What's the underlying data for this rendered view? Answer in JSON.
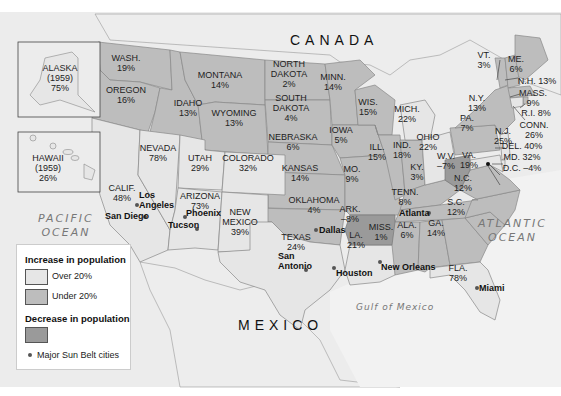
{
  "map": {
    "countries": {
      "canada": "CANADA",
      "mexico": "MEXICO"
    },
    "water": {
      "pacific": "PACIFIC\nOCEAN",
      "atlantic": "ATLANTIC\nOCEAN",
      "gulf": "Gulf of Mexico"
    },
    "colors": {
      "over20": "#e6e6e6",
      "under20": "#bdbdbd",
      "decrease": "#9a9a9a",
      "background": "#ececec",
      "water": "#f3f3f3"
    },
    "insets": {
      "alaska": {
        "label": "ALASKA\n(1959)\n75%",
        "category": "over20"
      },
      "hawaii": {
        "label": "HAWAII\n(1959)\n26%",
        "category": "over20"
      }
    },
    "states": [
      {
        "name": "WASH.",
        "change": "19%",
        "category": "under20"
      },
      {
        "name": "OREGON",
        "change": "16%",
        "category": "under20"
      },
      {
        "name": "CALIF.",
        "change": "48%",
        "category": "over20"
      },
      {
        "name": "NEVADA",
        "change": "78%",
        "category": "over20"
      },
      {
        "name": "IDAHO",
        "change": "13%",
        "category": "under20"
      },
      {
        "name": "MONTANA",
        "change": "14%",
        "category": "under20"
      },
      {
        "name": "WYOMING",
        "change": "13%",
        "category": "under20"
      },
      {
        "name": "UTAH",
        "change": "29%",
        "category": "over20"
      },
      {
        "name": "ARIZONA",
        "change": "73%",
        "category": "over20"
      },
      {
        "name": "COLORADO",
        "change": "32%",
        "category": "over20"
      },
      {
        "name": "NEW\nMEXICO",
        "change": "39%",
        "category": "over20"
      },
      {
        "name": "NORTH\nDAKOTA",
        "change": "2%",
        "category": "under20"
      },
      {
        "name": "SOUTH\nDAKOTA",
        "change": "4%",
        "category": "under20"
      },
      {
        "name": "NEBRASKA",
        "change": "6%",
        "category": "under20"
      },
      {
        "name": "KANSAS",
        "change": "14%",
        "category": "under20"
      },
      {
        "name": "OKLAHOMA",
        "change": "4%",
        "category": "under20"
      },
      {
        "name": "TEXAS",
        "change": "24%",
        "category": "over20"
      },
      {
        "name": "MINN.",
        "change": "14%",
        "category": "under20"
      },
      {
        "name": "IOWA",
        "change": "5%",
        "category": "under20"
      },
      {
        "name": "MO.",
        "change": "9%",
        "category": "under20"
      },
      {
        "name": "ARK.",
        "change": "-8%",
        "category": "decrease"
      },
      {
        "name": "LA.",
        "change": "21%",
        "category": "over20"
      },
      {
        "name": "WIS.",
        "change": "15%",
        "category": "under20"
      },
      {
        "name": "ILL.",
        "change": "15%",
        "category": "under20"
      },
      {
        "name": "MICH.",
        "change": "22%",
        "category": "over20"
      },
      {
        "name": "IND.",
        "change": "18%",
        "category": "under20"
      },
      {
        "name": "OHIO",
        "change": "22%",
        "category": "over20"
      },
      {
        "name": "KY.",
        "change": "3%",
        "category": "under20"
      },
      {
        "name": "TENN.",
        "change": "8%",
        "category": "under20"
      },
      {
        "name": "MISS.",
        "change": "1%",
        "category": "under20"
      },
      {
        "name": "ALA.",
        "change": "6%",
        "category": "under20"
      },
      {
        "name": "GA.",
        "change": "14%",
        "category": "under20"
      },
      {
        "name": "FLA.",
        "change": "78%",
        "category": "over20"
      },
      {
        "name": "S.C.",
        "change": "12%",
        "category": "under20"
      },
      {
        "name": "N.C.",
        "change": "12%",
        "category": "under20"
      },
      {
        "name": "VA.",
        "change": "19%",
        "category": "under20"
      },
      {
        "name": "W.V.",
        "change": "-7%",
        "category": "decrease"
      },
      {
        "name": "PA.",
        "change": "7%",
        "category": "under20"
      },
      {
        "name": "N.Y.",
        "change": "13%",
        "category": "under20"
      },
      {
        "name": "VT.",
        "change": "3%",
        "category": "under20"
      },
      {
        "name": "ME.",
        "change": "6%",
        "category": "under20"
      },
      {
        "name": "N.H.",
        "change": "13%",
        "category": "under20"
      },
      {
        "name": "MASS.",
        "change": "9%",
        "category": "under20"
      },
      {
        "name": "R.I.",
        "change": "8%",
        "category": "under20"
      },
      {
        "name": "CONN.",
        "change": "26%",
        "category": "over20"
      },
      {
        "name": "N.J.",
        "change": "25%",
        "category": "over20"
      },
      {
        "name": "DEL.",
        "change": "40%",
        "category": "over20"
      },
      {
        "name": "MD.",
        "change": "32%",
        "category": "over20"
      },
      {
        "name": "D.C.",
        "change": "-4%",
        "category": "decrease"
      }
    ],
    "labels": {
      "wash": "WASH.\n19%",
      "oregon": "OREGON\n16%",
      "calif": "CALIF.\n48%",
      "nevada": "NEVADA\n78%",
      "idaho": "IDAHO\n13%",
      "montana": "MONTANA\n14%",
      "wyoming": "WYOMING\n13%",
      "utah": "UTAH\n29%",
      "arizona": "ARIZONA\n73%",
      "colorado": "COLORADO\n32%",
      "newmexico": "NEW\nMEXICO\n39%",
      "nd": "NORTH\nDAKOTA\n2%",
      "sd": "SOUTH\nDAKOTA\n4%",
      "nebraska": "NEBRASKA\n6%",
      "kansas": "KANSAS\n14%",
      "oklahoma": "OKLAHOMA\n4%",
      "texas": "TEXAS\n24%",
      "minn": "MINN.\n14%",
      "iowa": "IOWA\n5%",
      "mo": "MO.\n9%",
      "ark": "ARK.\n–8%",
      "la": "LA.\n21%",
      "wis": "WIS.\n15%",
      "ill": "ILL.\n15%",
      "mich": "MICH.\n22%",
      "ind": "IND.\n18%",
      "ohio": "OHIO\n22%",
      "ky": "KY.\n3%",
      "tenn": "TENN.\n8%",
      "miss": "MISS.\n1%",
      "ala": "ALA.\n6%",
      "ga": "GA.\n14%",
      "fla": "FLA.\n78%",
      "sc": "S.C.\n12%",
      "nc": "N.C.\n12%",
      "va": "VA.\n19%",
      "wv": "W.V.\n–7%",
      "pa": "PA.\n7%",
      "ny": "N.Y.\n13%",
      "vt": "VT.\n3%",
      "me": "ME.\n6%",
      "nh": "N.H. 13%",
      "mass": "MASS.\n9%",
      "ri": "R.I. 8%",
      "conn": "CONN.\n26%",
      "nj": "N.J.\n25%",
      "del": "DEL. 40%",
      "md": "MD. 32%",
      "dc": "D.C. –4%"
    },
    "cities": [
      {
        "name": "Los\nAngeles"
      },
      {
        "name": "San Diego"
      },
      {
        "name": "Phoenix"
      },
      {
        "name": "Tucson"
      },
      {
        "name": "Dallas"
      },
      {
        "name": "San\nAntonio"
      },
      {
        "name": "Houston"
      },
      {
        "name": "New Orleans"
      },
      {
        "name": "Atlanta"
      },
      {
        "name": "Miami"
      }
    ]
  },
  "legend": {
    "increase_title": "Increase in population",
    "over20": "Over 20%",
    "under20": "Under 20%",
    "decrease_title": "Decrease in population",
    "cities": "Major Sun Belt cities"
  }
}
